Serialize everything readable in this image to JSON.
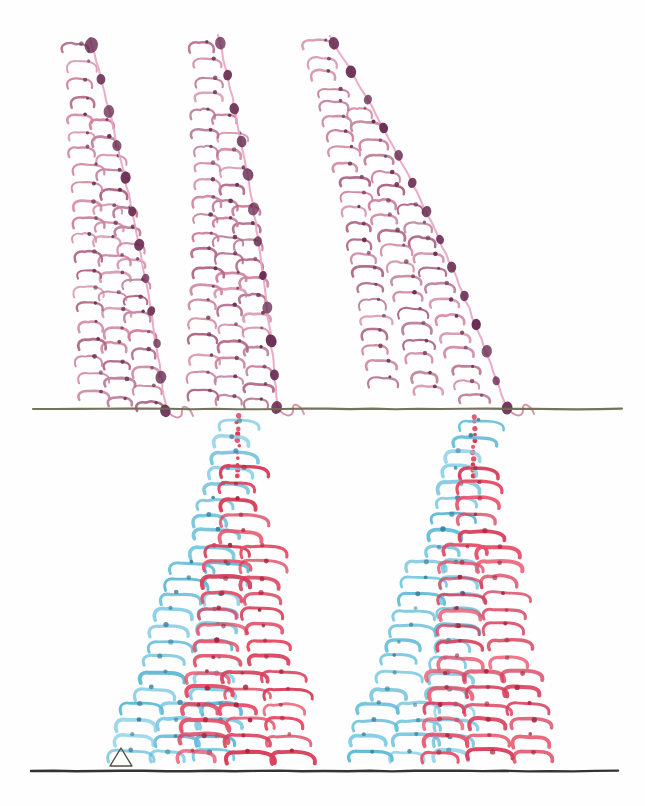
{
  "figure": {
    "background_color": "#fefefe",
    "width": 645,
    "height": 806
  },
  "palette": {
    "pink_stem": "#e9a8c4",
    "pink_branch": "#d4879f",
    "pink_branch_dark": "#b06a86",
    "node_dot": "#6b3055",
    "red": "#e8516a",
    "red_dark": "#d8405c",
    "blue": "#7ecbe4",
    "blue_dark": "#63bcd9",
    "ground_line": "#6e6a55",
    "base_line": "#2b2722",
    "triangle_outline": "#555044"
  },
  "lines": {
    "ground_line": {
      "name": "soil-surface-line",
      "x1": 33,
      "y1": 409,
      "x2": 622,
      "y2": 409,
      "color": "#6e6a55",
      "width": 2.1
    },
    "base_line": {
      "name": "baseline",
      "x1": 31,
      "y1": 771,
      "x2": 618,
      "y2": 771,
      "color": "#2b2722",
      "width": 2.4
    }
  },
  "marker": {
    "name": "scale-triangle",
    "shape": "hollow-triangle",
    "cx": 121,
    "cy": 757,
    "half_width": 11,
    "height": 18,
    "stroke": "#555044",
    "stroke_width": 1.4,
    "fill": "none"
  },
  "upper_structures": {
    "label": "aerial-shoots",
    "count": 3,
    "color_stem": "#e9a8c4",
    "color_node": "#6b3055",
    "color_branch": "#cf839e",
    "shoots": [
      {
        "id": "shoot-1",
        "apex_x": 90,
        "apex_y": 38,
        "base_x": 166,
        "base_y": 412,
        "bow": 14,
        "node_count": 12,
        "branch_rows": 21,
        "row_width_top": 34,
        "row_width_bottom": 96,
        "row_slant": 0.2
      },
      {
        "id": "shoot-2",
        "apex_x": 218,
        "apex_y": 35,
        "base_x": 277,
        "base_y": 410,
        "bow": 16,
        "node_count": 12,
        "branch_rows": 21,
        "row_width_top": 34,
        "row_width_bottom": 98,
        "row_slant": 0.2
      },
      {
        "id": "shoot-3",
        "apex_x": 330,
        "apex_y": 36,
        "base_x": 507,
        "base_y": 410,
        "bow": 26,
        "node_count": 14,
        "branch_rows": 23,
        "row_width_top": 38,
        "row_width_bottom": 150,
        "row_slant": 0.22
      }
    ]
  },
  "lower_structures": {
    "label": "root-fans",
    "count": 2,
    "color_left": "#7ecbe4",
    "color_right": "#e8516a",
    "color_axis_dots": "#e0364f",
    "fans": [
      {
        "id": "fan-1",
        "axis_x": 228,
        "top_y": 414,
        "bottom_y": 745,
        "dotted_rows": 5,
        "rows": 22,
        "left_span_top": 12,
        "left_span_bottom": 132,
        "right_span_top": 14,
        "right_span_bottom": 150,
        "left_drift": -7,
        "right_drift": 62
      },
      {
        "id": "fan-2",
        "axis_x": 464,
        "top_y": 414,
        "bottom_y": 745,
        "dotted_rows": 5,
        "rows": 22,
        "left_span_top": 12,
        "left_span_bottom": 130,
        "right_span_top": 14,
        "right_span_bottom": 150,
        "left_drift": -7,
        "right_drift": 70
      }
    ]
  }
}
